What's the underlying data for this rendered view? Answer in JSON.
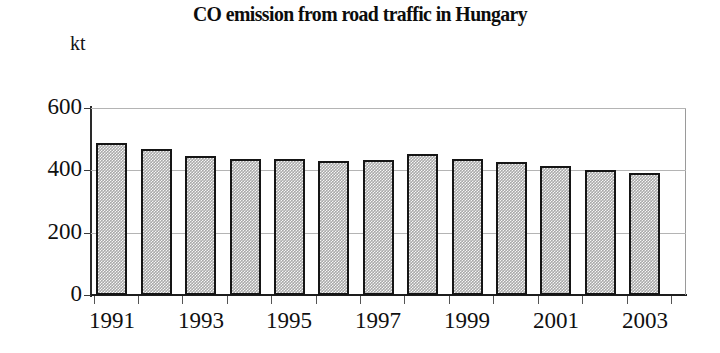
{
  "chart_data": {
    "type": "bar",
    "title": "CO emission from road traffic in Hungary",
    "xlabel": "",
    "ylabel": "kt",
    "ylim": [
      0,
      600
    ],
    "yticks": [
      0,
      200,
      400,
      600
    ],
    "ytick_labels": [
      "0",
      "200",
      "400",
      "600"
    ],
    "grid": true,
    "legend": "none",
    "categories": [
      "1991",
      "1992",
      "1993",
      "1994",
      "1995",
      "1996",
      "1997",
      "1998",
      "1999",
      "2000",
      "2001",
      "2002",
      "2003"
    ],
    "visible_tick_labels": [
      "1991",
      "1993",
      "1995",
      "1997",
      "1999",
      "2001",
      "2003"
    ],
    "values": [
      489,
      470,
      445,
      438,
      435,
      429,
      432,
      451,
      435,
      426,
      413,
      400,
      390
    ],
    "bar_fill_color": "#a9a9a9",
    "bar_edge_color": "#151515",
    "grid_color": "#b4b4b4",
    "axis_color": "#1d1d1d",
    "background_color": "#ffffff"
  }
}
